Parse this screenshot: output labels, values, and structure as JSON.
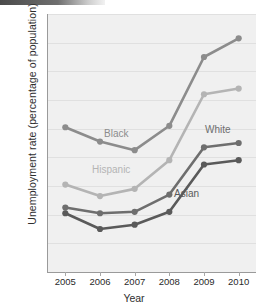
{
  "chart_data": {
    "type": "line",
    "title": "",
    "xlabel": "Year",
    "ylabel": "Unemployment rate (percentage of population)",
    "categories": [
      "2005",
      "2006",
      "2007",
      "2008",
      "2009",
      "2010"
    ],
    "x": [
      2005,
      2006,
      2007,
      2008,
      2009,
      2010
    ],
    "ylim": [
      0,
      18
    ],
    "ytick_labels": [
      "0%",
      "2%",
      "4%",
      "6%",
      "8%",
      "10%",
      "12%",
      "14%",
      "16%",
      "18%"
    ],
    "ytick_values": [
      0,
      2,
      4,
      6,
      8,
      10,
      12,
      14,
      16,
      18
    ],
    "grid": true,
    "legend_position": "inline-labels",
    "series": [
      {
        "name": "Black",
        "label": "Black",
        "color": "#8c8c8c",
        "values": [
          10.1,
          9.1,
          8.5,
          10.2,
          15.0,
          16.3
        ]
      },
      {
        "name": "Hispanic",
        "label": "Hispanic",
        "color": "#b4b4b4",
        "values": [
          6.1,
          5.3,
          5.8,
          7.8,
          12.4,
          12.8
        ]
      },
      {
        "name": "White",
        "label": "White",
        "color": "#6e6e6e",
        "values": [
          4.5,
          4.1,
          4.2,
          5.4,
          8.7,
          9.0
        ]
      },
      {
        "name": "Asian",
        "label": "Asian",
        "color": "#5a5a5a",
        "values": [
          4.1,
          3.0,
          3.3,
          4.2,
          7.5,
          7.8
        ]
      }
    ],
    "annotations": [
      {
        "text": "Black",
        "series": "Black"
      },
      {
        "text": "Hispanic",
        "series": "Hispanic"
      },
      {
        "text": "White",
        "series": "White"
      },
      {
        "text": "Asian",
        "series": "Asian"
      }
    ]
  },
  "axis": {
    "y_title": "Unemployment rate (percentage of population)",
    "x_title": "Year"
  }
}
